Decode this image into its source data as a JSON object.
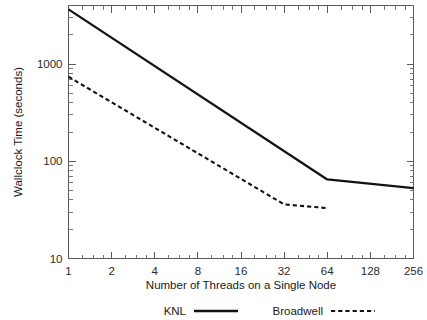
{
  "chart_data": {
    "type": "line",
    "title": "",
    "xlabel": "Number of Threads on a Single Node",
    "ylabel": "Wallclock Time (seconds)",
    "xscale": "log2",
    "yscale": "log10",
    "xlim": [
      1,
      256
    ],
    "ylim": [
      10,
      4000
    ],
    "xticks": [
      1,
      2,
      4,
      8,
      16,
      32,
      64,
      128,
      256
    ],
    "xtick_labels": [
      "1",
      "2",
      "4",
      "8",
      "16",
      "32",
      "64",
      "128",
      "256"
    ],
    "yticks": [
      10,
      100,
      1000
    ],
    "ytick_labels": [
      "10",
      "100",
      "1000"
    ],
    "grid": false,
    "legend_position": "below",
    "series": [
      {
        "name": "KNL",
        "style": "solid",
        "color": "#131313",
        "x": [
          1,
          64,
          256
        ],
        "values": [
          3650,
          65,
          53
        ]
      },
      {
        "name": "Broadwell",
        "style": "dashed",
        "color": "#131313",
        "x": [
          1,
          32,
          64
        ],
        "values": [
          740,
          36,
          33
        ]
      }
    ]
  },
  "axes": {
    "x_title": "Number of Threads on a Single Node",
    "y_title": "Wallclock Time (seconds)",
    "x_tick_labels": [
      "1",
      "2",
      "4",
      "8",
      "16",
      "32",
      "64",
      "128",
      "256"
    ],
    "y_tick_labels": [
      "1000",
      "100",
      "10"
    ]
  },
  "legend": {
    "entries": [
      {
        "label": "KNL",
        "style": "solid"
      },
      {
        "label": "Broadwell",
        "style": "dashed"
      }
    ]
  },
  "colors": {
    "line": "#131313",
    "axis": "#5a5a5a",
    "text": "#1a1a1a",
    "background": "#ffffff"
  }
}
